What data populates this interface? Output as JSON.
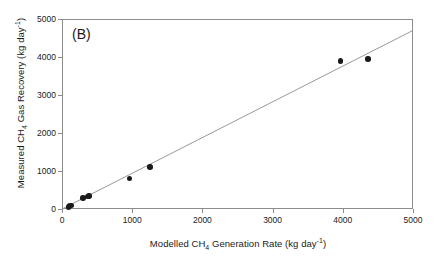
{
  "panel": {
    "label": "(B)"
  },
  "chart_data": {
    "type": "scatter",
    "title": "(B)",
    "xlabel": "Modelled CH4 Generation Rate (kg day-1)",
    "ylabel": "Measured CH4 Gas Recovery (kg day-1)",
    "xlabel_parts": {
      "pre": "Modelled CH",
      "sub": "4",
      "mid": " Generation Rate (kg day",
      "sup": "-1",
      "post": ")"
    },
    "ylabel_parts": {
      "pre": "Measured CH",
      "sub": "4",
      "mid": " Gas Recovery (kg day",
      "sup": "-1",
      "post": ")"
    },
    "xlim": [
      0,
      5000
    ],
    "ylim": [
      0,
      5000
    ],
    "xticks": [
      0,
      1000,
      2000,
      3000,
      4000,
      5000
    ],
    "yticks": [
      0,
      1000,
      2000,
      3000,
      4000,
      5000
    ],
    "xticklabels": [
      "0",
      "1000",
      "2000",
      "3000",
      "4000",
      "5000"
    ],
    "yticklabels": [
      "0",
      "1000",
      "2000",
      "3000",
      "4000",
      "5000"
    ],
    "grid": false,
    "legend": null,
    "marker": "filled-circle",
    "marker_color": "#1a1a1a",
    "line_color": "#8c8c8c",
    "frame_color": "#8c8c8c",
    "points": [
      {
        "x": 95,
        "y": 55
      },
      {
        "x": 110,
        "y": 75
      },
      {
        "x": 135,
        "y": 95
      },
      {
        "x": 300,
        "y": 285
      },
      {
        "x": 360,
        "y": 330
      },
      {
        "x": 385,
        "y": 340
      },
      {
        "x": 960,
        "y": 800
      },
      {
        "x": 1250,
        "y": 1105
      },
      {
        "x": 3970,
        "y": 3900
      },
      {
        "x": 4360,
        "y": 3945
      }
    ],
    "fit_line": {
      "x_start": 0,
      "y_start": 0,
      "x_end": 5000,
      "y_end": 4700
    }
  }
}
